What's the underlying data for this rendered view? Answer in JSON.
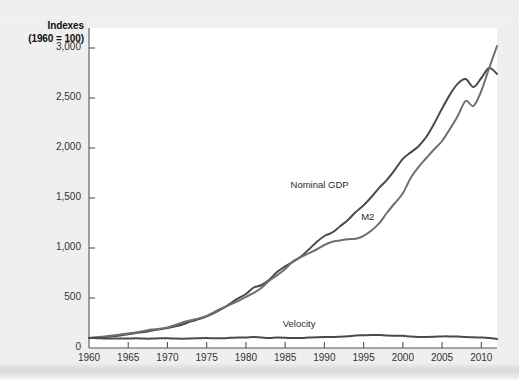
{
  "figure": {
    "background_color": "#efefef",
    "plot_background_color": "#ffffff",
    "axis_color": "#555555"
  },
  "axis": {
    "y_title_line1": "Indexes",
    "y_title_line2": "(1960 = 100)"
  },
  "chart_data": {
    "type": "line",
    "title": "",
    "subtitle": "",
    "xlabel": "",
    "ylabel": "Indexes (1960 = 100)",
    "xlim": [
      1960,
      2012
    ],
    "ylim": [
      0,
      3200
    ],
    "grid": false,
    "legend": "inline-annotations",
    "ytick_labels": [
      "0",
      "500",
      "1,000",
      "1,500",
      "2,000",
      "2,500",
      "3,000"
    ],
    "ytick_values": [
      0,
      500,
      1000,
      1500,
      2000,
      2500,
      3000
    ],
    "xtick_labels": [
      "1960",
      "1965",
      "1970",
      "1975",
      "1980",
      "1985",
      "1990",
      "1995",
      "2000",
      "2005",
      "2010"
    ],
    "xtick_values": [
      1960,
      1965,
      1970,
      1975,
      1980,
      1985,
      1990,
      1995,
      2000,
      2005,
      2010
    ],
    "x": [
      1960,
      1961,
      1962,
      1963,
      1964,
      1965,
      1966,
      1967,
      1968,
      1969,
      1970,
      1971,
      1972,
      1973,
      1974,
      1975,
      1976,
      1977,
      1978,
      1979,
      1980,
      1981,
      1982,
      1983,
      1984,
      1985,
      1986,
      1987,
      1988,
      1989,
      1990,
      1991,
      1992,
      1993,
      1994,
      1995,
      1996,
      1997,
      1998,
      1999,
      2000,
      2001,
      2002,
      2003,
      2004,
      2005,
      2006,
      2007,
      2008,
      2009,
      2010,
      2011,
      2012
    ],
    "series": [
      {
        "name": "Nominal GDP",
        "color": "#4a4a4a",
        "label_x": 1989,
        "label_y": 1620,
        "values": [
          100,
          104,
          111,
          117,
          126,
          137,
          150,
          159,
          174,
          188,
          199,
          216,
          238,
          266,
          289,
          316,
          352,
          393,
          444,
          496,
          540,
          605,
          630,
          685,
          762,
          816,
          862,
          914,
          985,
          1058,
          1120,
          1155,
          1217,
          1280,
          1360,
          1428,
          1510,
          1603,
          1684,
          1784,
          1892,
          1956,
          2018,
          2112,
          2246,
          2394,
          2534,
          2644,
          2690,
          2610,
          2700,
          2800,
          2740
        ]
      },
      {
        "name": "M2",
        "color": "#6f6f6f",
        "label_x": 1998,
        "label_y": 1300,
        "values": [
          100,
          107,
          116,
          125,
          135,
          146,
          155,
          170,
          185,
          192,
          206,
          231,
          257,
          277,
          296,
          321,
          360,
          400,
          434,
          469,
          512,
          551,
          603,
          676,
          729,
          790,
          868,
          910,
          947,
          985,
          1030,
          1063,
          1076,
          1088,
          1092,
          1122,
          1175,
          1248,
          1355,
          1450,
          1548,
          1700,
          1810,
          1900,
          1988,
          2070,
          2190,
          2320,
          2470,
          2420,
          2570,
          2800,
          3020
        ]
      },
      {
        "name": "Velocity",
        "color": "#4a4a4a",
        "label_x": 1988,
        "label_y": 230,
        "values": [
          100,
          98,
          96,
          94,
          94,
          94,
          97,
          94,
          94,
          98,
          97,
          94,
          93,
          96,
          98,
          99,
          98,
          98,
          102,
          106,
          106,
          110,
          105,
          101,
          105,
          103,
          99,
          100,
          104,
          107,
          109,
          109,
          113,
          118,
          125,
          127,
          129,
          129,
          124,
          123,
          122,
          115,
          111,
          111,
          113,
          116,
          116,
          114,
          109,
          108,
          105,
          100,
          91
        ]
      }
    ],
    "annotations": [
      {
        "text": "Nominal GDP",
        "x": 1989,
        "y": 1620
      },
      {
        "text": "M2",
        "x": 1998,
        "y": 1300
      },
      {
        "text": "Velocity",
        "x": 1988,
        "y": 230
      }
    ]
  }
}
